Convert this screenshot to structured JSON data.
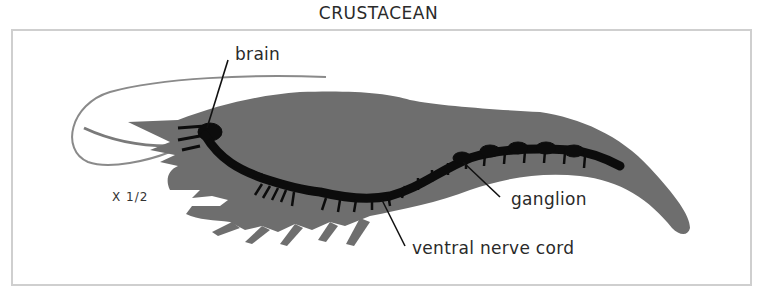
{
  "title": "CRUSTACEAN",
  "scale_note": "X 1/2",
  "labels": {
    "brain": "brain",
    "ganglion": "ganglion",
    "ventral_nerve_cord": "ventral nerve cord"
  },
  "colors": {
    "body": "#6e6e6e",
    "nervous_system": "#0c0c0c",
    "antenna": "#8a8a8a",
    "frame": "#cfcfcf",
    "leader_line": "#111111"
  }
}
